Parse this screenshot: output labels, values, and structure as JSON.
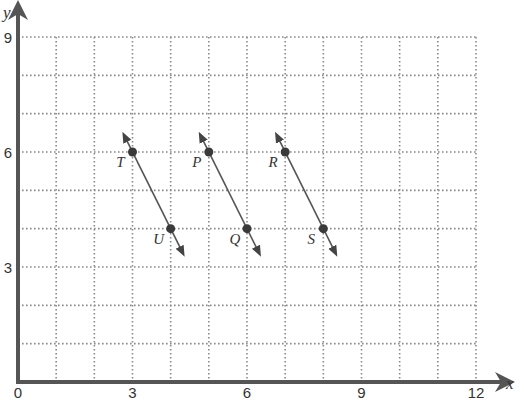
{
  "chart_data": {
    "type": "scatter",
    "title": "",
    "xlabel": "x",
    "ylabel": "y",
    "xlim": [
      0,
      12
    ],
    "ylim": [
      0,
      9
    ],
    "grid": true,
    "grid_style": "dotted, 1 unit spacing",
    "x_ticks": [
      0,
      3,
      6,
      9,
      12
    ],
    "y_ticks": [
      3,
      6,
      9
    ],
    "points": [
      {
        "label": "T",
        "x": 3,
        "y": 6
      },
      {
        "label": "U",
        "x": 4,
        "y": 4
      },
      {
        "label": "P",
        "x": 5,
        "y": 6
      },
      {
        "label": "Q",
        "x": 6,
        "y": 4
      },
      {
        "label": "R",
        "x": 7,
        "y": 6
      },
      {
        "label": "S",
        "x": 8,
        "y": 4
      }
    ],
    "lines": [
      {
        "name": "line-TU",
        "through": [
          "T",
          "U"
        ],
        "from": [
          2.8,
          6.4
        ],
        "to": [
          4.3,
          3.4
        ]
      },
      {
        "name": "line-PQ",
        "through": [
          "P",
          "Q"
        ],
        "from": [
          4.8,
          6.4
        ],
        "to": [
          6.3,
          3.4
        ]
      },
      {
        "name": "line-RS",
        "through": [
          "R",
          "S"
        ],
        "from": [
          6.8,
          6.4
        ],
        "to": [
          8.3,
          3.4
        ]
      }
    ]
  },
  "colors": {
    "axis": "#555555",
    "grid": "#8a8a8a",
    "line": "#555555",
    "point": "#3a3a3a",
    "text": "#333333"
  }
}
